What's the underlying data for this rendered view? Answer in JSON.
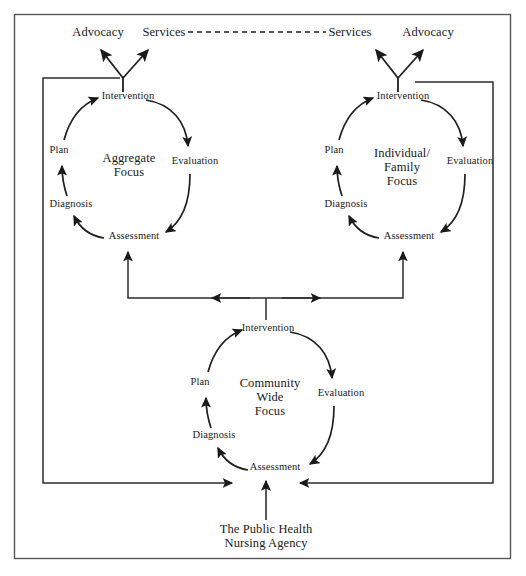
{
  "figure": {
    "caption": "",
    "frame": {
      "outer_border_color": "#4a4a4a",
      "inner_line_color": "#3a3a3a",
      "arrow_color": "#1a1a1a",
      "background": "#ffffff"
    }
  },
  "outputs": {
    "advocacy_left": "Advocacy",
    "services_left": "Services",
    "services_right": "Services",
    "advocacy_right": "Advocacy",
    "link_style": "dashed"
  },
  "cycles": [
    {
      "id": "aggregate",
      "center_label": "Aggregate\nFocus",
      "center_lines": [
        "Aggregate",
        "Focus"
      ],
      "steps": [
        {
          "name": "Intervention",
          "position": "top"
        },
        {
          "name": "Evaluation",
          "position": "right"
        },
        {
          "name": "Assessment",
          "position": "bottom"
        },
        {
          "name": "Diagnosis",
          "position": "left-lower"
        },
        {
          "name": "Plan",
          "position": "left-upper"
        }
      ]
    },
    {
      "id": "individual-family",
      "center_label": "Individual/\nFamily\nFocus",
      "center_lines": [
        "Individual/",
        "Family",
        "Focus"
      ],
      "steps": [
        {
          "name": "Intervention",
          "position": "top"
        },
        {
          "name": "Evaluation",
          "position": "right"
        },
        {
          "name": "Assessment",
          "position": "bottom"
        },
        {
          "name": "Diagnosis",
          "position": "left-lower"
        },
        {
          "name": "Plan",
          "position": "left-upper"
        }
      ]
    },
    {
      "id": "community-wide",
      "center_label": "Community\nWide\nFocus",
      "center_lines": [
        "Community",
        "Wide",
        "Focus"
      ],
      "steps": [
        {
          "name": "Intervention",
          "position": "top"
        },
        {
          "name": "Evaluation",
          "position": "right"
        },
        {
          "name": "Assessment",
          "position": "bottom"
        },
        {
          "name": "Diagnosis",
          "position": "left-lower"
        },
        {
          "name": "Plan",
          "position": "left-upper"
        }
      ]
    }
  ],
  "source": {
    "label_lines": [
      "The Public Health",
      "Nursing Agency"
    ],
    "label": "The Public Health Nursing Agency"
  }
}
